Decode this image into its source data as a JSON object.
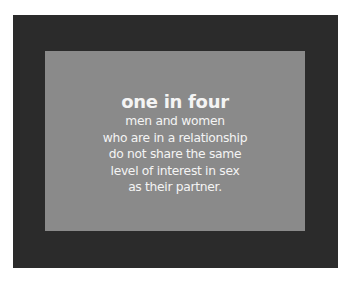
{
  "card": {
    "headline": "one in four",
    "lines": [
      "men and women",
      "who are in a relationship",
      "do not share the same",
      "level of interest in sex",
      "as their partner."
    ]
  },
  "colors": {
    "outer": "#2b2b2b",
    "inner": "#8a8a8a",
    "text": "#f4f4f4"
  }
}
